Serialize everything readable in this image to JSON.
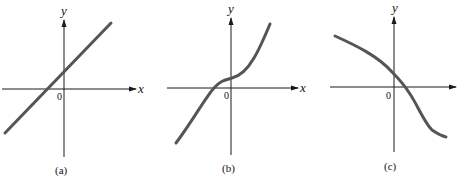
{
  "figure": {
    "panels": [
      {
        "id": "a",
        "caption": "(a)",
        "x_label": "x",
        "y_label": "y",
        "origin_label": "0",
        "description": "Increasing straight line crossing x-axis left of origin and y-axis above origin",
        "curve_color": "#555555"
      },
      {
        "id": "b",
        "caption": "(b)",
        "x_label": "x",
        "y_label": "y",
        "origin_label": "0",
        "description": "Increasing S-shaped curve that flattens near the origin, crossing x-axis left of origin",
        "curve_color": "#555555"
      },
      {
        "id": "c",
        "caption": "(c)",
        "x_label": "x",
        "y_label": "y",
        "origin_label": "0",
        "description": "Decreasing curve crossing y-axis above origin and x-axis right of origin, steepening then leveling off",
        "curve_color": "#555555"
      }
    ]
  }
}
